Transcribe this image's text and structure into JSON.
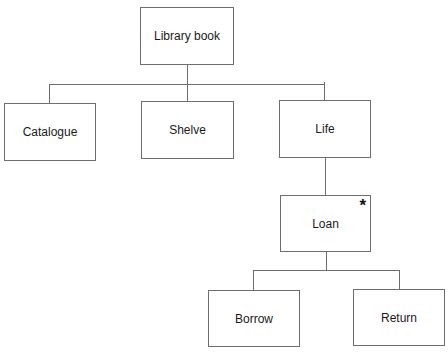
{
  "diagram": {
    "type": "JSP structure diagram",
    "colors": {
      "line": "#6e6e6e",
      "text": "#1a1a1a",
      "background": "#ffffff"
    },
    "nodes": [
      {
        "id": "root",
        "label": "Library book",
        "parent": null,
        "marker": ""
      },
      {
        "id": "catalogue",
        "label": "Catalogue",
        "parent": "root",
        "marker": ""
      },
      {
        "id": "shelve",
        "label": "Shelve",
        "parent": "root",
        "marker": ""
      },
      {
        "id": "life",
        "label": "Life",
        "parent": "root",
        "marker": ""
      },
      {
        "id": "loan",
        "label": "Loan",
        "parent": "life",
        "marker": "*"
      },
      {
        "id": "borrow",
        "label": "Borrow",
        "parent": "loan",
        "marker": ""
      },
      {
        "id": "return",
        "label": "Return",
        "parent": "loan",
        "marker": ""
      }
    ],
    "labels": {
      "root": "Library book",
      "catalogue": "Catalogue",
      "shelve": "Shelve",
      "life": "Life",
      "loan": "Loan",
      "loan_marker": "*",
      "borrow": "Borrow",
      "return": "Return"
    }
  }
}
